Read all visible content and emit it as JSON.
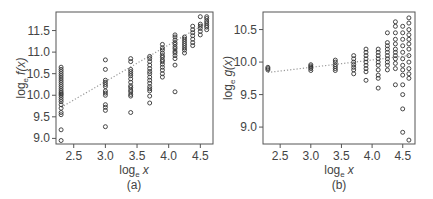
{
  "chart_data": [
    {
      "type": "scatter",
      "panel_label": "(a)",
      "xlabel": "log_e x",
      "ylabel": "log_e f(x)",
      "xlim": [
        2.22,
        4.7
      ],
      "ylim": [
        8.87,
        11.93
      ],
      "xticks": [
        2.5,
        3.0,
        3.5,
        4.0,
        4.5
      ],
      "yticks": [
        9.0,
        9.5,
        10.0,
        10.5,
        11.0,
        11.5
      ],
      "grid": false,
      "trend_line": {
        "style": "dotted",
        "x": [
          2.3,
          4.6
        ],
        "y": [
          9.72,
          11.68
        ]
      },
      "series": [
        {
          "x": 2.3,
          "values": [
            8.95,
            9.2,
            9.55,
            9.6,
            9.7,
            9.78,
            9.85,
            9.9,
            9.95,
            10.0,
            10.03,
            10.06,
            10.1,
            10.15,
            10.2,
            10.25,
            10.3,
            10.35,
            10.4,
            10.45,
            10.5,
            10.55,
            10.6,
            10.65
          ]
        },
        {
          "x": 3.0,
          "values": [
            9.27,
            9.65,
            9.72,
            9.78,
            10.0,
            10.05,
            10.1,
            10.2,
            10.25,
            10.3,
            10.35,
            10.6,
            10.82
          ]
        },
        {
          "x": 3.4,
          "values": [
            9.6,
            9.98,
            10.02,
            10.08,
            10.12,
            10.18,
            10.22,
            10.3,
            10.38,
            10.45,
            10.5,
            10.55,
            10.6,
            10.78,
            10.85
          ]
        },
        {
          "x": 3.7,
          "values": [
            9.82,
            9.98,
            10.1,
            10.15,
            10.2,
            10.28,
            10.35,
            10.42,
            10.5,
            10.55,
            10.62,
            10.7,
            10.78,
            10.85,
            10.9
          ]
        },
        {
          "x": 3.9,
          "values": [
            10.42,
            10.5,
            10.58,
            10.65,
            10.72,
            10.78,
            10.82,
            10.88,
            10.92,
            10.98,
            11.05,
            11.1,
            11.18
          ]
        },
        {
          "x": 4.1,
          "values": [
            10.08,
            10.7,
            10.85,
            10.92,
            10.98,
            11.02,
            11.08,
            11.12,
            11.18,
            11.22,
            11.28,
            11.35,
            11.4
          ]
        },
        {
          "x": 4.25,
          "values": [
            10.98,
            11.05,
            11.1,
            11.15,
            11.2,
            11.25,
            11.3,
            11.35
          ]
        },
        {
          "x": 4.38,
          "values": [
            11.15,
            11.22,
            11.3,
            11.38,
            11.45,
            11.52,
            11.6
          ]
        },
        {
          "x": 4.5,
          "values": [
            11.4,
            11.48,
            11.55,
            11.6,
            11.65,
            11.82
          ]
        },
        {
          "x": 4.6,
          "values": [
            11.52,
            11.58,
            11.62,
            11.67,
            11.72,
            11.78,
            11.82
          ]
        }
      ]
    },
    {
      "type": "scatter",
      "panel_label": "(b)",
      "xlabel": "log_e x",
      "ylabel": "log_e g(x)",
      "xlim": [
        2.22,
        4.7
      ],
      "ylim": [
        8.74,
        10.77
      ],
      "xticks": [
        2.5,
        3.0,
        3.5,
        4.0,
        4.5
      ],
      "yticks": [
        9.0,
        9.5,
        10.0,
        10.5
      ],
      "grid": false,
      "trend_line": {
        "style": "dotted",
        "x": [
          2.3,
          4.6
        ],
        "y": [
          9.84,
          10.1
        ]
      },
      "series": [
        {
          "x": 2.3,
          "values": [
            9.88,
            9.9,
            9.92
          ]
        },
        {
          "x": 3.0,
          "values": [
            9.87,
            9.9,
            9.92,
            9.94,
            9.96
          ]
        },
        {
          "x": 3.4,
          "values": [
            9.87,
            9.9,
            9.93,
            9.96,
            10.0,
            10.03
          ]
        },
        {
          "x": 3.7,
          "values": [
            9.82,
            9.88,
            9.92,
            9.96,
            10.0,
            10.05,
            10.1
          ]
        },
        {
          "x": 3.9,
          "values": [
            9.72,
            9.85,
            9.9,
            9.95,
            10.0,
            10.05,
            10.1,
            10.15,
            10.2
          ]
        },
        {
          "x": 4.1,
          "values": [
            9.6,
            9.75,
            9.8,
            9.88,
            9.95,
            10.0,
            10.05,
            10.1,
            10.15,
            10.2
          ]
        },
        {
          "x": 4.25,
          "values": [
            9.88,
            9.95,
            10.0,
            10.05,
            10.1,
            10.15,
            10.2,
            10.25,
            10.3,
            10.45
          ]
        },
        {
          "x": 4.38,
          "values": [
            9.65,
            9.9,
            9.98,
            10.05,
            10.1,
            10.15,
            10.2,
            10.28,
            10.35,
            10.45,
            10.55,
            10.62
          ]
        },
        {
          "x": 4.5,
          "values": [
            8.92,
            9.28,
            9.5,
            9.65,
            9.8,
            9.88,
            9.95,
            10.05,
            10.15,
            10.25,
            10.35,
            10.45,
            10.55
          ]
        },
        {
          "x": 4.6,
          "values": [
            8.8,
            9.75,
            9.82,
            9.9,
            10.0,
            10.1,
            10.2,
            10.28,
            10.35,
            10.42,
            10.5,
            10.6,
            10.68
          ]
        }
      ]
    }
  ],
  "panels": [
    {
      "label": "(a)",
      "xlabel_main": "log",
      "xlabel_sub": "e",
      "xlabel_var": "x",
      "ylabel_main": "log",
      "ylabel_sub": "e",
      "ylabel_func": "f(x)",
      "xtick_labels": [
        "2.5",
        "3.0",
        "3.5",
        "4.0",
        "4.5"
      ],
      "ytick_labels": [
        "9.0",
        "9.5",
        "10.0",
        "10.5",
        "11.0",
        "11.5"
      ]
    },
    {
      "label": "(b)",
      "xlabel_main": "log",
      "xlabel_sub": "e",
      "xlabel_var": "x",
      "ylabel_main": "log",
      "ylabel_sub": "e",
      "ylabel_func": "g(x)",
      "xtick_labels": [
        "2.5",
        "3.0",
        "3.5",
        "4.0",
        "4.5"
      ],
      "ytick_labels": [
        "9.0",
        "9.5",
        "10.0",
        "10.5"
      ]
    }
  ],
  "colors": {
    "marker": "#333333",
    "frame": "#555555",
    "trend": "#999999"
  }
}
